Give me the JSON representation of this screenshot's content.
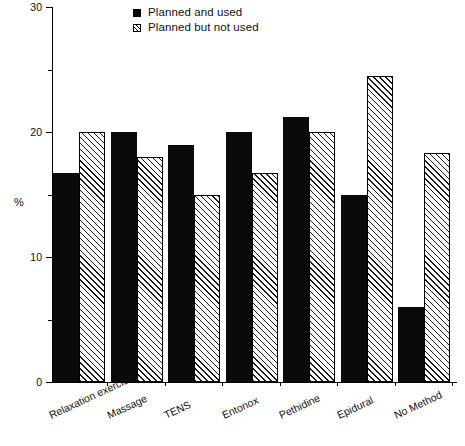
{
  "chart_data": {
    "type": "bar",
    "title": "",
    "subtitle": "",
    "xlabel": "",
    "ylabel": "%",
    "ylim": [
      0,
      30
    ],
    "yticks": [
      0,
      10,
      20,
      30
    ],
    "yticks_minor": [
      5,
      15,
      25
    ],
    "grid": false,
    "legend_position": "top-center",
    "categories": [
      "Relaxation exercises",
      "Massage",
      "TENS",
      "Entonox",
      "Pethidine",
      "Epidural",
      "No Method"
    ],
    "series": [
      {
        "name": "Planned and used",
        "fill": "solid-black",
        "values": [
          16.7,
          20.0,
          19.0,
          20.0,
          21.2,
          15.0,
          6.0
        ]
      },
      {
        "name": "Planned but not used",
        "fill": "diagonal-hatch",
        "values": [
          20.0,
          18.0,
          15.0,
          16.7,
          20.0,
          24.5,
          18.3
        ]
      }
    ]
  },
  "axis": {
    "y_title": "%",
    "y_tick_labels": [
      "0",
      "10",
      "20",
      "30"
    ]
  },
  "legend": {
    "items": [
      {
        "label": "Planned and used",
        "swatch": "solid-square-icon"
      },
      {
        "label": "Planned but not used",
        "swatch": "hatched-square-icon"
      }
    ]
  },
  "colors": {
    "series_1": "#0a0a0a",
    "series_2": "#ffffff",
    "hatch": "#1a1a1a",
    "axis": "#000000",
    "background": "#ffffff"
  }
}
